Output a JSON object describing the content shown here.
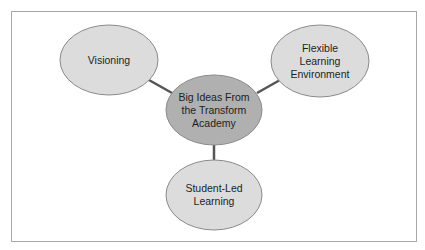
{
  "diagram": {
    "type": "hub-and-spoke concept map",
    "colors": {
      "frame_border": "#a8a8a8",
      "connector": "#555555",
      "center_fill": "#b0b0b0",
      "outer_fill": "#dcdcdc",
      "ellipse_stroke": "#8a8a8a",
      "text": "#1e1e1e"
    },
    "center": {
      "label_lines": [
        "Big Ideas From",
        "the Transform",
        "Academy"
      ],
      "cx": 214,
      "cy": 110,
      "rx": 48,
      "ry": 35
    },
    "nodes": [
      {
        "id": "visioning",
        "label_lines": [
          "Visioning"
        ],
        "cx": 109,
        "cy": 60,
        "rx": 49,
        "ry": 35
      },
      {
        "id": "flexible-learning-environment",
        "label_lines": [
          "Flexible",
          "Learning",
          "Environment"
        ],
        "cx": 320,
        "cy": 61,
        "rx": 49,
        "ry": 36
      },
      {
        "id": "student-led-learning",
        "label_lines": [
          "Student-Led",
          "Learning"
        ],
        "cx": 214,
        "cy": 195,
        "rx": 48,
        "ry": 35
      }
    ],
    "connectors": [
      {
        "from": "center",
        "to": "visioning",
        "x1": 172,
        "y1": 93,
        "x2": 149,
        "y2": 80
      },
      {
        "from": "center",
        "to": "flexible-learning-environment",
        "x1": 257,
        "y1": 93,
        "x2": 280,
        "y2": 80
      },
      {
        "from": "center",
        "to": "student-led-learning",
        "x1": 214,
        "y1": 145,
        "x2": 214,
        "y2": 160
      }
    ]
  }
}
